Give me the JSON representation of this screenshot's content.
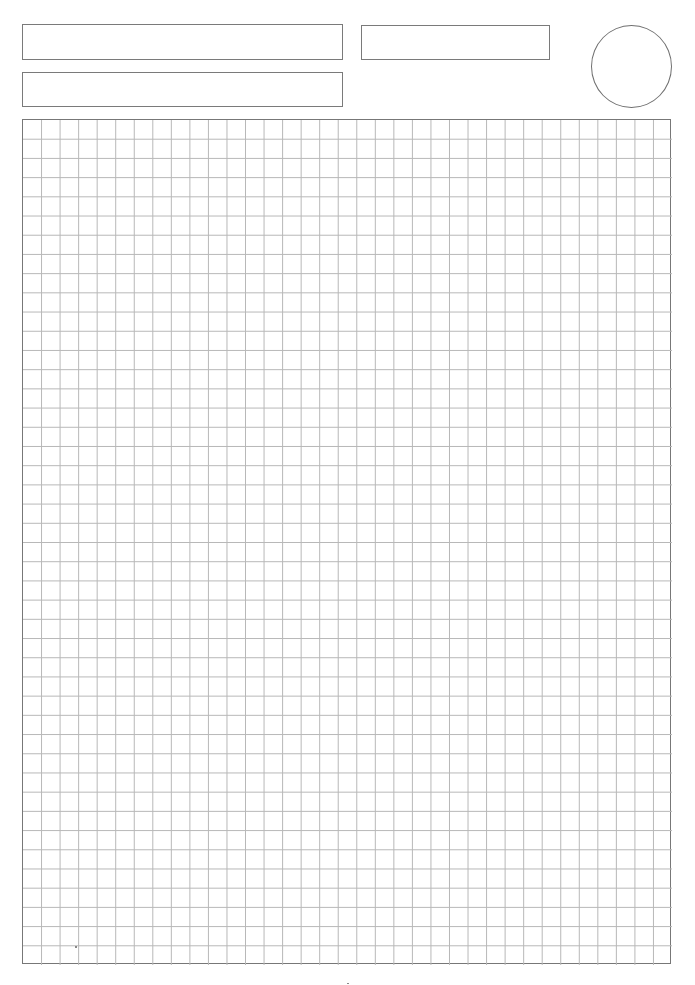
{
  "page": {
    "type": "grid-paper-template",
    "background": "#ffffff"
  },
  "header": {
    "fields": [
      {
        "id": "name",
        "value": ""
      },
      {
        "id": "date",
        "value": ""
      },
      {
        "id": "subject",
        "value": ""
      }
    ],
    "photo_circle": {
      "value": ""
    }
  },
  "grid": {
    "columns": 35,
    "rows": 44,
    "line_color": "#b8b8b8",
    "border_color": "#777777"
  },
  "footer": {
    "page_mark": ""
  }
}
